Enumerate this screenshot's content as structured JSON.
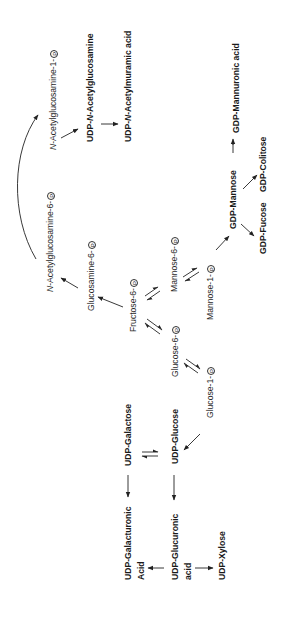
{
  "diagram": {
    "type": "metabolic-pathway",
    "orientation": "rotated-90-ccw",
    "phosphate_symbol": "P",
    "nodes": {
      "n_acetylglucosamine_1_p": {
        "prefix": "N",
        "text": "-Acetylglucosamine-1-"
      },
      "udp_n_acetylglucosamine": {
        "pre": "UDP-",
        "it": "N",
        "post": "-Acetylglucosamine"
      },
      "udp_n_acetylmuramic_acid": {
        "pre": "UDP-",
        "it": "N",
        "post": "-Acetylmuramic acid"
      },
      "gdp_mannuronic_acid": {
        "text": "GDP-Mannuronic acid"
      },
      "gdp_colitose": {
        "text": "GDP-Colitose"
      },
      "gdp_mannose": {
        "text": "GDP-Mannose"
      },
      "gdp_fucose": {
        "text": "GDP-Fucose"
      },
      "n_acetylglucosamine_6_p": {
        "prefix": "N",
        "text": "-Acetylglucosamine-6-"
      },
      "glucosamine_6_p": {
        "text": "Glucosamine-6-"
      },
      "fructose_6_p": {
        "text": "Fructose-6-"
      },
      "mannose_6_p": {
        "text": "Mannose-6-"
      },
      "mannose_1_p": {
        "text": "Mannose-1-"
      },
      "glucose_6_p": {
        "text": "Glucose-6-"
      },
      "glucose_1_p": {
        "text": "Glucose-1-"
      },
      "udp_galactose": {
        "text": "UDP-Galactose"
      },
      "udp_glucose": {
        "text": "UDP-Glucose"
      },
      "udp_galacturonic_acid": {
        "line1": "UDP-Galacturonic",
        "line2": "Acid"
      },
      "udp_glucuronic_acid": {
        "line1": "UDP-Glucuronic",
        "line2": "acid"
      },
      "udp_xylose": {
        "text": "UDP-Xylose"
      }
    },
    "edges": [
      {
        "from": "Fructose-6-P",
        "to": "Glucosamine-6-P",
        "type": "irreversible"
      },
      {
        "from": "Glucosamine-6-P",
        "to": "N-Acetylglucosamine-6-P",
        "type": "irreversible"
      },
      {
        "from": "N-Acetylglucosamine-6-P",
        "to": "N-Acetylglucosamine-1-P",
        "type": "irreversible-curved"
      },
      {
        "from": "N-Acetylglucosamine-1-P",
        "to": "UDP-N-Acetylglucosamine",
        "type": "irreversible"
      },
      {
        "from": "UDP-N-Acetylglucosamine",
        "to": "UDP-N-Acetylmuramic acid",
        "type": "irreversible"
      },
      {
        "from": "Fructose-6-P",
        "to": "Mannose-6-P",
        "type": "reversible"
      },
      {
        "from": "Mannose-6-P",
        "to": "Mannose-1-P",
        "type": "reversible"
      },
      {
        "from": "Mannose-1-P",
        "to": "GDP-Mannose",
        "type": "irreversible"
      },
      {
        "from": "GDP-Mannose",
        "to": "GDP-Mannuronic acid",
        "type": "irreversible"
      },
      {
        "from": "GDP-Mannose",
        "to": "GDP-Colitose",
        "type": "irreversible"
      },
      {
        "from": "GDP-Mannose",
        "to": "GDP-Fucose",
        "type": "irreversible"
      },
      {
        "from": "Fructose-6-P",
        "to": "Glucose-6-P",
        "type": "reversible"
      },
      {
        "from": "Glucose-6-P",
        "to": "Glucose-1-P",
        "type": "reversible"
      },
      {
        "from": "Glucose-1-P",
        "to": "UDP-Glucose",
        "type": "irreversible"
      },
      {
        "from": "UDP-Glucose",
        "to": "UDP-Galactose",
        "type": "reversible"
      },
      {
        "from": "UDP-Galactose",
        "to": "UDP-Galacturonic Acid",
        "type": "irreversible"
      },
      {
        "from": "UDP-Glucose",
        "to": "UDP-Glucuronic acid",
        "type": "irreversible"
      },
      {
        "from": "UDP-Glucuronic acid",
        "to": "UDP-Galacturonic Acid",
        "type": "irreversible"
      },
      {
        "from": "UDP-Glucuronic acid",
        "to": "UDP-Xylose",
        "type": "irreversible"
      }
    ]
  }
}
